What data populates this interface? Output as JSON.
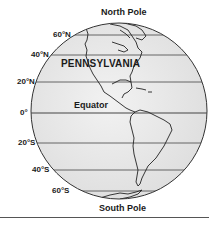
{
  "diagram": {
    "title_top": "North Pole",
    "title_bottom": "South Pole",
    "region_label": "PENNSYLVANIA",
    "equator_label": "Equator",
    "latitudes": [
      {
        "label": "60°N",
        "y": 35
      },
      {
        "label": "40°N",
        "y": 55
      },
      {
        "label": "20°N",
        "y": 82
      },
      {
        "label": "0°",
        "y": 113
      },
      {
        "label": "20°S",
        "y": 143
      },
      {
        "label": "40°S",
        "y": 170
      },
      {
        "label": "60°S",
        "y": 191
      }
    ],
    "colors": {
      "globe_fill": "#e9e9e9",
      "outline": "#333333",
      "lines": "#444444",
      "text": "#1a1a1a"
    }
  }
}
